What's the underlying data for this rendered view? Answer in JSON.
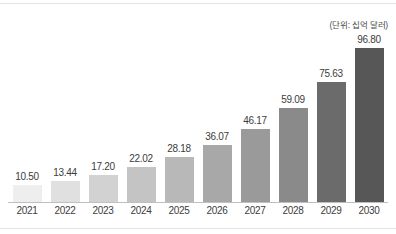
{
  "chart_data": {
    "type": "bar",
    "title": "",
    "subtitle": "",
    "unit_note": "(단위: 십억 달러)",
    "xlabel": "",
    "ylabel": "",
    "ylim": [
      0,
      96.8
    ],
    "grid": false,
    "legend": null,
    "categories": [
      "2021",
      "2022",
      "2023",
      "2024",
      "2025",
      "2026",
      "2027",
      "2028",
      "2029",
      "2030"
    ],
    "values": [
      10.5,
      13.44,
      17.2,
      22.02,
      28.18,
      36.07,
      46.17,
      59.09,
      75.63,
      96.8
    ],
    "value_labels": [
      "10.50",
      "13.44",
      "17.20",
      "22.02",
      "28.18",
      "36.07",
      "46.17",
      "59.09",
      "75.63",
      "96.80"
    ],
    "bar_colors": [
      "#eeeeee",
      "#e0e0e0",
      "#d2d2d2",
      "#c4c4c4",
      "#b8b8b8",
      "#a8a8a8",
      "#9a9a9a",
      "#8a8a8a",
      "#6b6b6b",
      "#575757"
    ],
    "axis_color": "#bfbfbf",
    "label_color": "#3c3c3c",
    "rule_color": "#e2e2e2"
  }
}
